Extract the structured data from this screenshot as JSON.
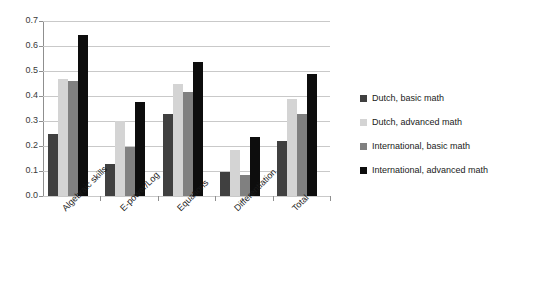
{
  "chart_data": {
    "type": "bar",
    "title": "",
    "xlabel": "",
    "ylabel": "",
    "ylim": [
      0.0,
      0.7
    ],
    "ytick_step": 0.1,
    "grid": true,
    "legend_position": "right",
    "orientation": "vertical-grouped",
    "categories": [
      "Algebraic skills",
      "E-power/Log",
      "Equations",
      "Differentiation",
      "Total"
    ],
    "ytick_labels": [
      "0.7",
      "0.6",
      "0.5",
      "0.4",
      "0.3",
      "0.2",
      "0.1",
      "0.0"
    ],
    "ytick_values": [
      0.7,
      0.6,
      0.5,
      0.4,
      0.3,
      0.2,
      0.1,
      0.0
    ],
    "series": [
      {
        "name": "Dutch, basic math",
        "color": "#404040",
        "values": [
          0.25,
          0.13,
          0.33,
          0.095,
          0.22
        ]
      },
      {
        "name": "Dutch, advanced math",
        "color": "#d4d4d4",
        "values": [
          0.47,
          0.3,
          0.45,
          0.185,
          0.39
        ]
      },
      {
        "name": "International, basic math",
        "color": "#808080",
        "values": [
          0.46,
          0.195,
          0.415,
          0.085,
          0.33
        ]
      },
      {
        "name": "International, advanced math",
        "color": "#0d0d0d",
        "values": [
          0.645,
          0.375,
          0.535,
          0.235,
          0.49
        ]
      }
    ]
  }
}
